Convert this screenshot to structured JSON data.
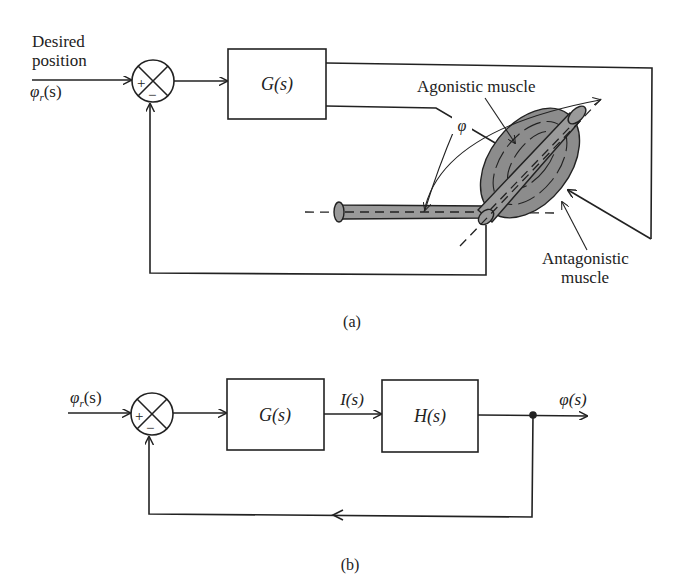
{
  "figure_a": {
    "caption": "(a)",
    "input_label_line1": "Desired",
    "input_label_line2": "position",
    "input_signal": "φr(s)",
    "input_signal_base": "φ",
    "input_signal_sub": "r",
    "input_signal_arg": "(s)",
    "summing_plus": "+",
    "summing_minus": "−",
    "controller_block": "G(s)",
    "angle_label": "φ",
    "agonistic_label": "Agonistic muscle",
    "antagonistic_label_line1": "Antagonistic",
    "antagonistic_label_line2": "muscle",
    "colors": {
      "muscle_fill": "#8c8c8c",
      "bone_fill": "#9a9a9a",
      "line": "#222222"
    }
  },
  "figure_b": {
    "caption": "(b)",
    "input_signal_base": "φ",
    "input_signal_sub": "r",
    "input_signal_arg": "(s)",
    "summing_plus": "+",
    "summing_minus": "−",
    "block1": "G(s)",
    "intermediate_signal": "I(s)",
    "block2": "H(s)",
    "output_signal": "φ(s)"
  }
}
